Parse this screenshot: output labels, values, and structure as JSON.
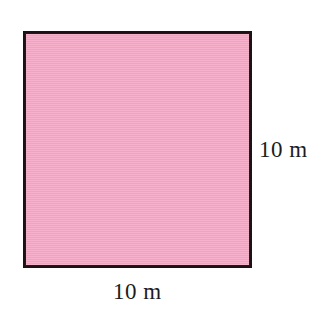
{
  "figure": {
    "type": "geometry-diagram",
    "shape": "square",
    "fill_color": "#f6a2c2",
    "stroke_color": "#1c1214",
    "background_color": "#ffffff",
    "labels": {
      "right_side": "10 m",
      "bottom_side": "10 m"
    }
  },
  "chart_data": {
    "type": "diagram",
    "shape": "square",
    "title": "",
    "xlabel": "",
    "ylabel": "",
    "dimensions": [
      {
        "side": "bottom",
        "label": "10 m",
        "value": 10,
        "unit": "m"
      },
      {
        "side": "right",
        "label": "10 m",
        "value": 10,
        "unit": "m"
      }
    ],
    "annotations": [
      "10 m",
      "10 m"
    ],
    "legend": [],
    "grid": false
  }
}
